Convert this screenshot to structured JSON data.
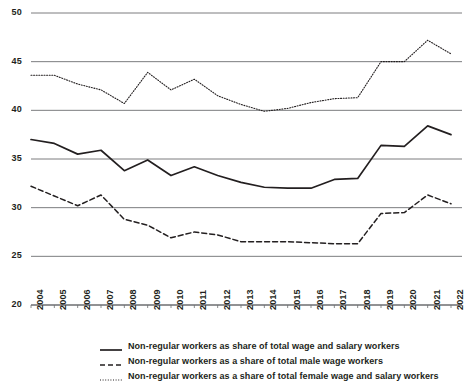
{
  "chart_data": {
    "type": "line",
    "title": "",
    "xlabel": "",
    "ylabel": "",
    "ylim": [
      20,
      50
    ],
    "ytick_values": [
      20,
      25,
      30,
      35,
      40,
      45,
      50
    ],
    "grid": true,
    "legend_position": "bottom",
    "x": [
      2004,
      2005,
      2006,
      2007,
      2008,
      2009,
      2010,
      2011,
      2012,
      2013,
      2014,
      2015,
      2016,
      2017,
      2018,
      2019,
      2020,
      2021,
      2022
    ],
    "categories": [
      "2004",
      "2005",
      "2006",
      "2007",
      "2008",
      "2009",
      "2010",
      "2011",
      "2012",
      "2013",
      "2014",
      "2015",
      "2016",
      "2017",
      "2018",
      "2019",
      "2020",
      "2021",
      "2022"
    ],
    "series": [
      {
        "name": "Non-regular workers as share of total wage and salary workers",
        "style": "solid",
        "color": "#231f20",
        "values": [
          37.0,
          36.6,
          35.5,
          35.9,
          33.8,
          34.9,
          33.3,
          34.2,
          33.3,
          32.6,
          32.1,
          32.0,
          32.0,
          32.9,
          33.0,
          36.4,
          36.3,
          38.4,
          37.5
        ]
      },
      {
        "name": "Non-regular workers as a share of total male wage workers",
        "style": "dashed",
        "color": "#231f20",
        "values": [
          32.2,
          31.2,
          30.2,
          31.3,
          28.8,
          28.2,
          26.9,
          27.5,
          27.2,
          26.5,
          26.5,
          26.5,
          26.4,
          26.3,
          26.3,
          29.4,
          29.5,
          31.3,
          30.4
        ]
      },
      {
        "name": "Non-regular workers as a share of total female wage and salary workers",
        "style": "dotted",
        "color": "#231f20",
        "values": [
          43.6,
          43.6,
          42.7,
          42.1,
          40.7,
          43.9,
          42.1,
          43.2,
          41.5,
          40.6,
          39.9,
          40.2,
          40.8,
          41.2,
          41.3,
          45.0,
          45.0,
          47.2,
          45.8
        ]
      }
    ]
  },
  "axis": {
    "y_labels": [
      "50",
      "45",
      "40",
      "35",
      "30",
      "25",
      "20"
    ],
    "x_labels": [
      "2004",
      "2005",
      "2006",
      "2007",
      "2008",
      "2009",
      "2010",
      "2011",
      "2012",
      "2013",
      "2014",
      "2015",
      "2016",
      "2017",
      "2018",
      "2019",
      "2020",
      "2021",
      "2022"
    ]
  },
  "legend": {
    "items": [
      {
        "label": "Non-regular workers as share of total wage and salary workers",
        "style": "solid"
      },
      {
        "label": "Non-regular workers as a share of total male wage workers",
        "style": "dashed"
      },
      {
        "label": "Non-regular workers as a share of total female wage and salary workers",
        "style": "dotted"
      }
    ]
  },
  "colors": {
    "line": "#231f20",
    "grid": "#6d6e71",
    "background": "#ffffff"
  }
}
